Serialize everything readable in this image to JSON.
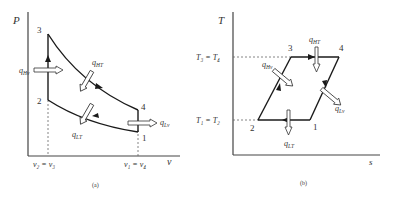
{
  "figure_a": {
    "caption": "(a)",
    "y_axis_label": "P",
    "x_axis_label": "v",
    "points": {
      "p1": "1",
      "p2": "2",
      "p3": "3",
      "p4": "4"
    },
    "x_ticks": {
      "left": "v₂ = v₃",
      "right": "v₁ = v₄"
    },
    "heat_labels": {
      "q_h_v": "q",
      "q_h_v_sub": "Hv",
      "q_h_t": "q",
      "q_h_t_sub": "HT",
      "q_l_t": "q",
      "q_l_t_sub": "LT",
      "q_l_v": "q",
      "q_l_v_sub": "Lv"
    }
  },
  "figure_b": {
    "caption": "(b)",
    "y_axis_label": "T",
    "x_axis_label": "s",
    "points": {
      "p1": "1",
      "p2": "2",
      "p3": "3",
      "p4": "4"
    },
    "y_ticks": {
      "top": "T₃ = T₄",
      "bottom": "T₁ = T₂"
    },
    "heat_labels": {
      "q_h_v": "q",
      "q_h_v_sub": "Hv",
      "q_h_t": "q",
      "q_h_t_sub": "HT",
      "q_l_t": "q",
      "q_l_t_sub": "LT",
      "q_l_v": "q",
      "q_l_v_sub": "Lv"
    }
  },
  "colors": {
    "line": "#1a1a1a",
    "text": "#333333",
    "dashed": "#555555"
  }
}
